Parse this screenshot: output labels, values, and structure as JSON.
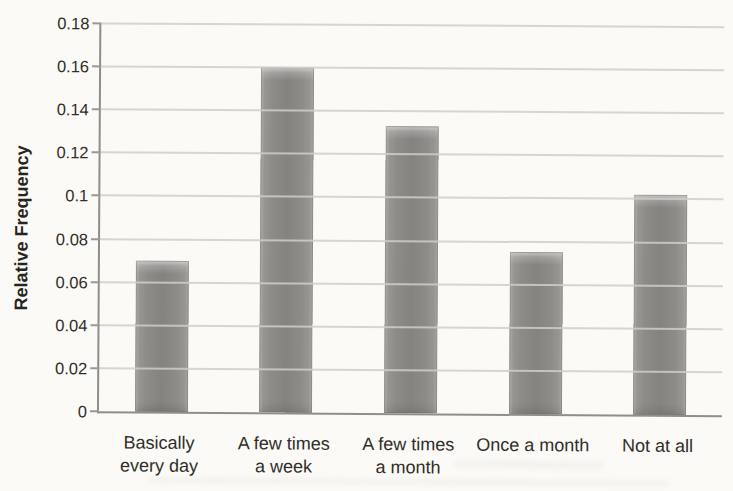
{
  "chart_data": {
    "type": "bar",
    "ylabel": "Relative Frequency",
    "xlabel": "",
    "ylim": [
      0,
      0.18
    ],
    "yticks": [
      0,
      0.02,
      0.04,
      0.06,
      0.08,
      0.1,
      0.12,
      0.14,
      0.16,
      0.18
    ],
    "ytick_labels": [
      "0",
      "0.02",
      "0.04",
      "0.06",
      "0.08",
      "0.1",
      "0.12",
      "0.14",
      "0.16",
      "0.18"
    ],
    "categories": [
      "Basically every day",
      "A few times a week",
      "A few times a month",
      "Once a month",
      "Not at all"
    ],
    "category_lines": [
      [
        "Basically",
        "every day"
      ],
      [
        "A few times",
        "a week"
      ],
      [
        "A few times",
        "a month"
      ],
      [
        "Once a month"
      ],
      [
        "Not at all"
      ]
    ],
    "values": [
      0.07,
      0.16,
      0.133,
      0.075,
      0.102
    ],
    "grid": true,
    "legend": false,
    "colors": {
      "bar": "#8a8a86",
      "bar_highlight": "#b7b6b2",
      "gridline": "#cfcec9",
      "axis": "#8f8e89",
      "text": "#2f2e2a",
      "background": "#fbfaf6"
    }
  }
}
